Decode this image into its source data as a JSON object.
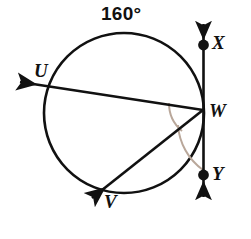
{
  "figure": {
    "kind": "circle-geometry-diagram",
    "background_color": "#ffffff",
    "stroke_color": "#111111",
    "arc_mark_color": "#b9a79a"
  },
  "arc_measure": {
    "value": "160",
    "degree_symbol": "°",
    "text": "160°"
  },
  "points": [
    {
      "id": "U",
      "label": "U",
      "type": "circle-point",
      "on": "circle"
    },
    {
      "id": "V",
      "label": "V",
      "type": "circle-point",
      "on": "circle"
    },
    {
      "id": "W",
      "label": "W",
      "type": "tangent-point",
      "on": "circle-and-line"
    },
    {
      "id": "X",
      "label": "X",
      "type": "line-point",
      "on": "tangent-line"
    },
    {
      "id": "Y",
      "label": "Y",
      "type": "line-point",
      "on": "tangent-line"
    }
  ],
  "rays": [
    {
      "id": "WU",
      "from": "W",
      "through": "U",
      "arrowhead": "end"
    },
    {
      "id": "WV",
      "from": "W",
      "through": "V",
      "arrowhead": "end"
    }
  ],
  "lines": [
    {
      "id": "XY",
      "label": "XY",
      "type": "tangent",
      "arrowhead": "both",
      "tangent_at": "W"
    }
  ],
  "angle_marks": [
    {
      "id": "angle-UWV",
      "between": [
        "WU",
        "WV"
      ],
      "vertex": "W",
      "size": "small"
    },
    {
      "id": "angle-VWY",
      "between": [
        "WV",
        "WY"
      ],
      "vertex": "W",
      "size": "large"
    }
  ]
}
